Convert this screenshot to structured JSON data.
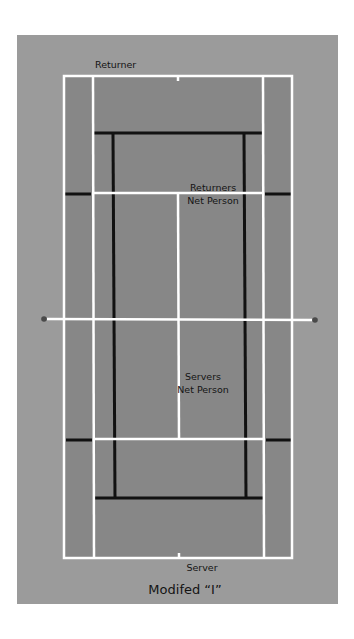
{
  "diagram": {
    "title": "Modifed “I”",
    "type": "tennis-doubles-formation",
    "colors": {
      "background": "#9b9b9b",
      "court": "#878787",
      "court_lines": "#ffffff",
      "positioning_lines": "#111111",
      "net_post": "#4a4a4a",
      "text": "#141414"
    },
    "labels": {
      "returner": "Returner",
      "returners_net_person_line1": "Returners",
      "returners_net_person_line2": "Net Person",
      "servers_net_person_line1": "Servers",
      "servers_net_person_line2": "Net Person",
      "server": "Server"
    }
  }
}
